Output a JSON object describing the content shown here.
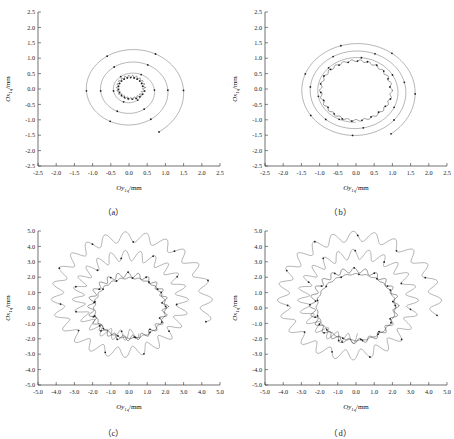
{
  "figure": {
    "panels": [
      {
        "id": "a",
        "caption": "（a）",
        "xlabel_main": "Oy",
        "xlabel_sub": "1q",
        "xlabel_unit": "/mm",
        "ylabel_main": "Ox",
        "ylabel_sub": "1q",
        "ylabel_unit": "/mm",
        "xticks": [
          "-2.5",
          "-2.0",
          "-1.5",
          "-1.0",
          "-0.5",
          "0.0",
          "0.5",
          "1.0",
          "1.5",
          "2.0",
          "2.5"
        ],
        "yticks": [
          "2.5",
          "2.0",
          "1.5",
          "1.0",
          "0.5",
          "0.0",
          "-0.5",
          "-1.0",
          "-1.5",
          "-2.0",
          "-2.5"
        ]
      },
      {
        "id": "b",
        "caption": "（b）",
        "xlabel_main": "Oy",
        "xlabel_sub": "1q",
        "xlabel_unit": "/mm",
        "ylabel_main": "Ox",
        "ylabel_sub": "1q",
        "ylabel_unit": "/mm",
        "xticks": [
          "-2.5",
          "-2.0",
          "-1.5",
          "-1.0",
          "-0.5",
          "0.0",
          "0.5",
          "1.0",
          "1.5",
          "2.0",
          "2.5"
        ],
        "yticks": [
          "2.5",
          "2.0",
          "1.5",
          "1.0",
          "0.5",
          "0.0",
          "-0.5",
          "-1.0",
          "-1.5",
          "-2.0",
          "-2.5"
        ]
      },
      {
        "id": "c",
        "caption": "（c）",
        "xlabel_main": "Oy",
        "xlabel_sub": "1q",
        "xlabel_unit": "/mm",
        "ylabel_main": "Ox",
        "ylabel_sub": "1q",
        "ylabel_unit": "/mm",
        "xticks": [
          "-5.0",
          "-4.0",
          "-3.0",
          "-2.0",
          "-1.0",
          "0.0",
          "1.0",
          "2.0",
          "3.0",
          "4.0",
          "5.0"
        ],
        "yticks": [
          "5.0",
          "4.0",
          "3.0",
          "2.0",
          "1.0",
          "0.0",
          "-1.0",
          "-2.0",
          "-3.0",
          "-4.0",
          "-5.0"
        ]
      },
      {
        "id": "d",
        "caption": "（d）",
        "xlabel_main": "Oy",
        "xlabel_sub": "1q",
        "xlabel_unit": "/mm",
        "ylabel_main": "Ox",
        "ylabel_sub": "1q",
        "ylabel_unit": "/mm",
        "xticks": [
          "-5.0",
          "-4.0",
          "-3.0",
          "-2.0",
          "-1.0",
          "0.0",
          "1.0",
          "2.0",
          "3.0",
          "4.0",
          "5.0"
        ],
        "yticks": [
          "5.0",
          "4.0",
          "3.0",
          "2.0",
          "1.0",
          "0.0",
          "-1.0",
          "-2.0",
          "-3.0",
          "-4.0",
          "-5.0"
        ]
      }
    ]
  },
  "chart_data": [
    {
      "type": "line",
      "panel": "a",
      "title": "",
      "xlabel": "Oy1q/mm",
      "ylabel": "Ox1q/mm",
      "xlim": [
        -2.5,
        2.5
      ],
      "ylim": [
        -2.5,
        2.5
      ],
      "xticks": [
        -2.5,
        -2.0,
        -1.5,
        -1.0,
        -0.5,
        0.0,
        0.5,
        1.0,
        1.5,
        2.0,
        2.5
      ],
      "yticks": [
        -2.5,
        -2.0,
        -1.5,
        -1.0,
        -0.5,
        0.0,
        0.5,
        1.0,
        1.5,
        2.0,
        2.5
      ],
      "grid": false,
      "legend": "none",
      "markers": "dot",
      "description": "Rotor centre orbit spiralling inward from radius about 1.55 mm to a small limit cycle of radius about 0.35 mm; trajectory makes roughly 3 decaying loops with dense oscillation near the centre.",
      "series": [
        {
          "name": "orbit-a",
          "spiral": {
            "r_start": 1.55,
            "r_end": 0.33,
            "turns": 3.1,
            "theta_start_deg": -60,
            "center": [
              0.05,
              -0.05
            ],
            "ripple_amp": 0.0,
            "ripple_lobes": 0,
            "points": 520
          }
        },
        {
          "name": "inner-limit-cycle-a",
          "circle": {
            "r": 0.36,
            "center": [
              0.05,
              0.05
            ],
            "ripple_amp": 0.04,
            "ripple_lobes": 22
          }
        }
      ],
      "marker_count": 40
    },
    {
      "type": "line",
      "panel": "b",
      "title": "",
      "xlabel": "Oy1q/mm",
      "ylabel": "Ox1q/mm",
      "xlim": [
        -2.5,
        2.5
      ],
      "ylim": [
        -2.5,
        2.5
      ],
      "xticks": [
        -2.5,
        -2.0,
        -1.5,
        -1.0,
        -0.5,
        0.0,
        0.5,
        1.0,
        1.5,
        2.0,
        2.5
      ],
      "yticks": [
        -2.5,
        -2.0,
        -1.5,
        -1.0,
        -0.5,
        0.0,
        0.5,
        1.0,
        1.5,
        2.0,
        2.5
      ],
      "grid": false,
      "legend": "none",
      "markers": "dot",
      "description": "Rotor centre orbit spiralling inward from radius about 1.65 mm and settling on a nearly circular limit cycle of radius about 0.98 mm.",
      "series": [
        {
          "name": "orbit-b",
          "spiral": {
            "r_start": 1.68,
            "r_end": 1.0,
            "turns": 2.9,
            "theta_start_deg": -55,
            "center": [
              0.0,
              -0.08
            ],
            "ripple_amp": 0.0,
            "ripple_lobes": 0,
            "points": 520
          }
        },
        {
          "name": "inner-limit-cycle-b",
          "circle": {
            "r": 0.97,
            "center": [
              0.0,
              -0.05
            ],
            "ripple_amp": 0.03,
            "ripple_lobes": 26
          }
        }
      ],
      "marker_count": 42
    },
    {
      "type": "line",
      "panel": "c",
      "title": "",
      "xlabel": "Oy1q/mm",
      "ylabel": "Ox1q/mm",
      "xlim": [
        -5.0,
        5.0
      ],
      "ylim": [
        -5.0,
        5.0
      ],
      "xticks": [
        -5.0,
        -4.0,
        -3.0,
        -2.0,
        -1.0,
        0.0,
        1.0,
        2.0,
        3.0,
        4.0,
        5.0
      ],
      "yticks": [
        -5.0,
        -4.0,
        -3.0,
        -2.0,
        -1.0,
        0.0,
        1.0,
        2.0,
        3.0,
        4.0,
        5.0
      ],
      "grid": false,
      "legend": "none",
      "markers": "dot",
      "description": "Scalloped quasi-periodic orbit with about 24 lobes decaying from radius about 4.6 mm to an inner scalloped limit cycle of radius about 2.1 mm.",
      "series": [
        {
          "name": "orbit-c",
          "spiral": {
            "r_start": 4.55,
            "r_end": 2.25,
            "turns": 1.85,
            "theta_start_deg": -18,
            "center": [
              -0.2,
              0.55
            ],
            "ripple_amp": 0.34,
            "ripple_lobes": 24,
            "points": 900
          }
        },
        {
          "name": "inner-limit-cycle-c",
          "circle": {
            "r": 2.05,
            "center": [
              -0.05,
              0.1
            ],
            "ripple_amp": 0.17,
            "ripple_lobes": 24
          }
        },
        {
          "name": "inner-limit-cycle-c2",
          "circle": {
            "r": 1.95,
            "center": [
              0.05,
              0.0
            ],
            "ripple_amp": 0.05,
            "ripple_lobes": 24
          }
        }
      ],
      "marker_count": 46
    },
    {
      "type": "line",
      "panel": "d",
      "title": "",
      "xlabel": "Oy1q/mm",
      "ylabel": "Ox1q/mm",
      "xlim": [
        -5.0,
        5.0
      ],
      "ylim": [
        -5.0,
        5.0
      ],
      "xticks": [
        -5.0,
        -4.0,
        -3.0,
        -2.0,
        -1.0,
        0.0,
        1.0,
        2.0,
        3.0,
        4.0,
        5.0
      ],
      "yticks": [
        -5.0,
        -4.0,
        -3.0,
        -2.0,
        -1.0,
        0.0,
        1.0,
        2.0,
        3.0,
        4.0,
        5.0
      ],
      "grid": false,
      "legend": "none",
      "markers": "dot",
      "description": "Scalloped quasi-periodic orbit with about 24 lobes decaying from radius about 4.6 mm to an inner scalloped limit cycle of radius about 2.3 mm.",
      "series": [
        {
          "name": "orbit-d",
          "spiral": {
            "r_start": 4.6,
            "r_end": 2.45,
            "turns": 1.8,
            "theta_start_deg": -12,
            "center": [
              -0.15,
              0.5
            ],
            "ripple_amp": 0.33,
            "ripple_lobes": 24,
            "points": 900
          }
        },
        {
          "name": "inner-limit-cycle-d",
          "circle": {
            "r": 2.3,
            "center": [
              -0.1,
              0.15
            ],
            "ripple_amp": 0.16,
            "ripple_lobes": 24
          }
        },
        {
          "name": "inner-limit-cycle-d2",
          "circle": {
            "r": 2.15,
            "center": [
              0.0,
              0.05
            ],
            "ripple_amp": 0.04,
            "ripple_lobes": 24
          }
        }
      ],
      "marker_count": 46
    }
  ]
}
